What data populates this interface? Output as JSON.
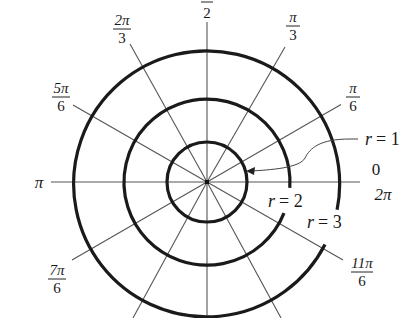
{
  "diagram": {
    "colors": {
      "background": "#ffffff",
      "circle_stroke": "#1a1a1a",
      "spoke_stroke": "#555555",
      "text": "#1a1a1a"
    },
    "center": {
      "x": 207,
      "y": 182
    },
    "circles": [
      {
        "r_value": 1,
        "label": "r = 1",
        "radius_px": 40
      },
      {
        "r_value": 2,
        "label": "r = 2",
        "radius_px": 83
      },
      {
        "r_value": 3,
        "label": "r = 3",
        "radius_px": 133
      }
    ],
    "angle_labels": [
      {
        "angle": "0",
        "num": "0",
        "den": "",
        "alt": "2π"
      },
      {
        "angle": "π/6",
        "num": "π",
        "den": "6"
      },
      {
        "angle": "π/3",
        "num": "π",
        "den": "3"
      },
      {
        "angle": "π/2",
        "num": "π",
        "den": "2"
      },
      {
        "angle": "2π/3",
        "num": "2π",
        "den": "3"
      },
      {
        "angle": "5π/6",
        "num": "5π",
        "den": "6"
      },
      {
        "angle": "π",
        "num": "π",
        "den": ""
      },
      {
        "angle": "7π/6",
        "num": "7π",
        "den": "6"
      },
      {
        "angle": "11π/6",
        "num": "11π",
        "den": "6"
      }
    ],
    "labels": {
      "zero": "0",
      "two_pi": "2π",
      "pi": "π",
      "pi_over_6_num": "π",
      "pi_over_6_den": "6",
      "pi_over_3_num": "π",
      "pi_over_3_den": "3",
      "pi_over_2_den": "2",
      "two_pi_over_3_num": "2π",
      "two_pi_over_3_den": "3",
      "five_pi_over_6_num": "5π",
      "five_pi_over_6_den": "6",
      "seven_pi_over_6_num": "7π",
      "seven_pi_over_6_den": "6",
      "eleven_pi_over_6_num": "11π",
      "eleven_pi_over_6_den": "6",
      "r1_var": "r",
      "r1_eq": "= 1",
      "r2_var": "r",
      "r2_eq": "= 2",
      "r3_var": "r",
      "r3_eq": "= 3"
    }
  }
}
